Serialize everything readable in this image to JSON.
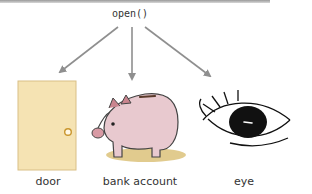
{
  "header": {
    "method": "open()"
  },
  "targets": [
    {
      "label": "door",
      "icon": "door-icon"
    },
    {
      "label": "bank account",
      "icon": "piggy-bank-icon"
    },
    {
      "label": "eye",
      "icon": "eye-icon"
    }
  ],
  "colors": {
    "arrow": "#8f8f8f",
    "door_fill": "#f5e3b3",
    "door_edge": "#d9bf86",
    "door_knob": "#c9962e",
    "pig_fill": "#e8c9cf",
    "pig_ear": "#c9848e",
    "ground": "#dcc27a",
    "eye_ink": "#111111"
  }
}
